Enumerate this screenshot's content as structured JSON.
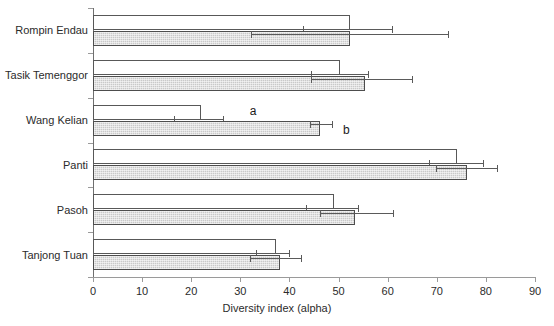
{
  "chart_data": {
    "type": "bar",
    "orientation": "horizontal",
    "title": "",
    "xlabel": "Diversity index (alpha)",
    "ylabel": "",
    "xlim": [
      0,
      90
    ],
    "xticks": [
      0,
      10,
      20,
      30,
      40,
      50,
      60,
      70,
      80,
      90
    ],
    "grid": false,
    "legend": null,
    "categories": [
      "Rompin Endau",
      "Tasik Temenggor",
      "Wang Kelian",
      "Panti",
      "Pasoh",
      "Tanjong Tuan"
    ],
    "series": [
      {
        "name": "open",
        "style": "white-bar",
        "color": "#ffffff",
        "values": [
          52.3,
          50.3,
          22.0,
          74.1,
          49.1,
          37.3
        ],
        "err_low": [
          42.8,
          44.4,
          16.5,
          68.4,
          43.4,
          33.1
        ],
        "err_high": [
          60.9,
          56.0,
          26.5,
          79.4,
          54.0,
          40.0
        ]
      },
      {
        "name": "filled",
        "style": "gray-hatched-bar",
        "color": "#c9c9c9",
        "values": [
          52.3,
          55.4,
          46.2,
          76.2,
          53.3,
          38.1
        ],
        "err_low": [
          32.2,
          44.4,
          44.2,
          69.8,
          46.2,
          32.0
        ],
        "err_high": [
          72.3,
          65.0,
          48.7,
          82.2,
          61.1,
          42.3
        ]
      }
    ],
    "annotations": [
      {
        "text": "a",
        "category": "Wang Kelian",
        "series": "open",
        "x": 31.9
      },
      {
        "text": "b",
        "category": "Wang Kelian",
        "series": "filled",
        "x": 50.9
      }
    ],
    "colors": {
      "open_fill": "#ffffff",
      "filled_fill": "#c9c9c9",
      "bar_outline": "#585858",
      "axis": "#9a9a9a",
      "error_bar": "#5a5a5a",
      "text": "#2b2b2b"
    }
  }
}
